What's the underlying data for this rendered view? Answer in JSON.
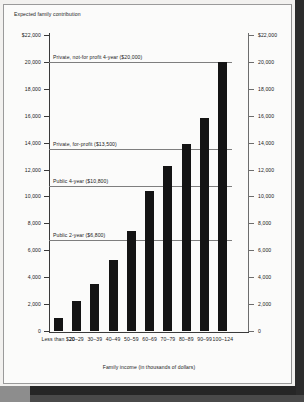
{
  "chart_data": {
    "type": "bar",
    "title": "",
    "ylabel": "Expected family contribution",
    "xlabel": "Family income (in thousands of dollars)",
    "categories": [
      "Less than $20",
      "20–29",
      "30–39",
      "40–49",
      "50–59",
      "60–69",
      "70–79",
      "80–89",
      "90–99",
      "100–124"
    ],
    "values": [
      1000,
      2200,
      3500,
      5300,
      7400,
      10400,
      12300,
      13900,
      15800,
      20000
    ],
    "ylim": [
      0,
      22000
    ],
    "grid": false,
    "legend": "none",
    "y_ticks": [
      0,
      2000,
      4000,
      6000,
      8000,
      10000,
      12000,
      14000,
      16000,
      18000,
      20000,
      22000
    ],
    "y_tick_labels": [
      "0",
      "2,000",
      "4,000",
      "6,000",
      "8,000",
      "10,000",
      "12,000",
      "14,000",
      "16,000",
      "18,000",
      "20,000",
      "$22,000"
    ],
    "y_ticks_right": [
      0,
      2000,
      4000,
      6000,
      8000,
      10000,
      12000,
      14000,
      16000,
      18000,
      20000,
      22000
    ],
    "y_tick_labels_right": [
      "0",
      "2,000",
      "4,000",
      "6,000",
      "8,000",
      "10,000",
      "12,000",
      "14,000",
      "16,000",
      "18,000",
      "20,000",
      "$22,000"
    ],
    "reference_lines": [
      {
        "label": "Private, not-for profit 4-year ($20,000)",
        "value": 20000
      },
      {
        "label": "Private, for-profit ($13,500)",
        "value": 13500
      },
      {
        "label": "Public 4-year ($10,800)",
        "value": 10800
      },
      {
        "label": "Public 2-year ($6,800)",
        "value": 6800
      }
    ],
    "bar_color": "#141414"
  }
}
